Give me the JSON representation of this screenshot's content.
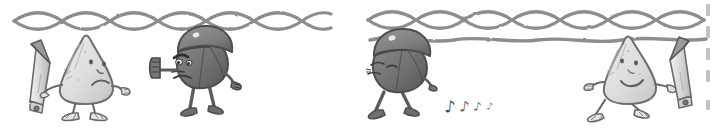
{
  "artwork": {
    "title": "Hand-drawn two-panel cartoon comic strip",
    "medium": "pencil sketch, grayscale",
    "background_color": "#ffffff",
    "ink_color": "#6e6e6e",
    "dark_fill": "#7a7a7a",
    "light_fill": "#dedede",
    "panel_count": 2
  },
  "panels": [
    {
      "id": "panel-left",
      "name": "left-panel",
      "border": {
        "type": "braided-rope",
        "position": "top",
        "strand_count": 2,
        "crossings": 9,
        "color": "#8a8a8a"
      },
      "characters": [
        {
          "id": "pear-sad",
          "name": "pear-character-sad",
          "shape": "teardrop",
          "tone": "light",
          "fill": "#e2e2e2",
          "facing": "right",
          "expression": "sad",
          "mouth": "frown",
          "eyes": "two-dots",
          "holding": "pencil",
          "pose": "standing"
        },
        {
          "id": "helmet-angry",
          "name": "helmet-character-angry",
          "shape": "round",
          "tone": "dark",
          "fill": "#7c7c7c",
          "facing": "left",
          "expression": "angry",
          "mouth": "frown",
          "eyes": "angry-slanted",
          "accessory": "helmet",
          "gesture": "raised-open-hand",
          "pose": "leaning-forward"
        }
      ],
      "props": [
        {
          "id": "pencil-left",
          "name": "pencil-prop",
          "tip_direction": "up-left",
          "body_color": "#dcdcdc",
          "tip_color": "#555555"
        }
      ]
    },
    {
      "id": "panel-right",
      "name": "right-panel",
      "border": {
        "type": "braided-rope",
        "position": "top",
        "strand_count": 2,
        "crossings": 9,
        "color": "#8a8a8a",
        "extra_line": {
          "type": "single-wavy-line",
          "color": "#8a8a8a"
        }
      },
      "characters": [
        {
          "id": "helmet-content",
          "name": "helmet-character-content",
          "shape": "round",
          "tone": "dark",
          "fill": "#7c7c7c",
          "facing": "left",
          "expression": "content",
          "mouth": "small-line",
          "eyes": "closed",
          "accessory": "helmet",
          "pose": "walking-away"
        },
        {
          "id": "pear-happy",
          "name": "pear-character-happy",
          "shape": "teardrop",
          "tone": "light",
          "fill": "#e2e2e2",
          "facing": "left",
          "expression": "happy",
          "mouth": "smile",
          "eyes": "two-dots",
          "holding": "pencil",
          "pose": "walking"
        }
      ],
      "props": [
        {
          "id": "pencil-right",
          "name": "pencil-prop",
          "tip_direction": "up-right",
          "body_color": "#dcdcdc",
          "tip_color": "#555555"
        }
      ],
      "effects": [
        {
          "id": "music-notes",
          "name": "music-note-trail",
          "glyph": "♪",
          "count": 4,
          "sizes": [
            16,
            14,
            12,
            9
          ],
          "meaning": "whistling / humming",
          "color": "#555555"
        }
      ]
    }
  ],
  "edge_marks": {
    "name": "page-edge-ticks",
    "side": "right",
    "count": 5,
    "color": "#bdbdbd"
  }
}
